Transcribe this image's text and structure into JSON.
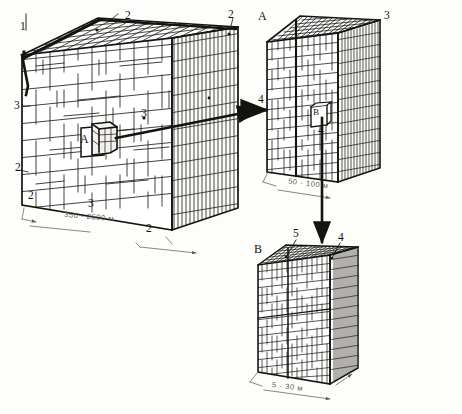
{
  "figure": {
    "units_note": "м",
    "background_color": "#fdfdfb",
    "ink_color": "#15130f"
  },
  "blocks": [
    {
      "id": "block-large",
      "name": "large-rock-mass-block",
      "dimension_label": "350 - 2500 м",
      "callouts": [
        {
          "id": "c1",
          "text": "1"
        },
        {
          "id": "c2a",
          "text": "2"
        },
        {
          "id": "c2b",
          "text": "2"
        },
        {
          "id": "c3a",
          "text": "3"
        },
        {
          "id": "c2c",
          "text": "2"
        },
        {
          "id": "c2d",
          "text": "2"
        },
        {
          "id": "c3b",
          "text": "3"
        },
        {
          "id": "c3c",
          "text": "3"
        },
        {
          "id": "c2e",
          "text": "2"
        }
      ],
      "inset_label": "A"
    },
    {
      "id": "block-medium",
      "name": "medium-rock-mass-block",
      "dimension_label": "50 - 100 м",
      "callouts": [
        {
          "id": "mA",
          "text": "A"
        },
        {
          "id": "m3",
          "text": "3"
        },
        {
          "id": "m4",
          "text": "4"
        },
        {
          "id": "m4b",
          "text": "4"
        }
      ],
      "inset_label": "B"
    },
    {
      "id": "block-small",
      "name": "small-rock-mass-block",
      "dimension_label": "5 - 30 м",
      "callouts": [
        {
          "id": "sB",
          "text": "B"
        },
        {
          "id": "s5",
          "text": "5"
        },
        {
          "id": "s4",
          "text": "4"
        }
      ]
    }
  ],
  "connectors": [
    {
      "id": "arrow-a",
      "name": "zoom-arrow-large-to-medium",
      "from": "inset-A",
      "to": "block-medium"
    },
    {
      "id": "arrow-b",
      "name": "zoom-arrow-medium-to-small",
      "from": "inset-B",
      "to": "block-small"
    },
    {
      "id": "arrow-in",
      "name": "pointer-arrow-left-medium",
      "from": "callout-4",
      "to": "block-medium-face"
    }
  ]
}
